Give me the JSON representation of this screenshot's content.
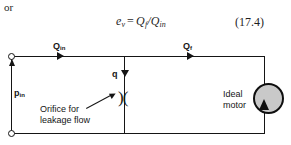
{
  "text": {
    "or": "or",
    "equation": {
      "lhs_var": "e",
      "lhs_sub": "v",
      "operator": "=",
      "num_var": "Q",
      "num_sub": "f",
      "slash": "/",
      "den_var": "Q",
      "den_sub": "in"
    },
    "equation_number": "(17.4)"
  },
  "diagram": {
    "labels": {
      "q_in_symbol": "Q",
      "q_in_sub": "in",
      "q_f_symbol": "Q",
      "q_f_sub": "f",
      "q_leak": "q",
      "p_in_symbol": "p",
      "p_in_sub": "in",
      "orifice_caption_line1": "Orifice for",
      "orifice_caption_line2": "leakage flow",
      "motor_caption_line1": "Ideal",
      "motor_caption_line2": "motor",
      "orifice_symbol": ")("
    },
    "colors": {
      "wire": "#151515",
      "motor_fill": "#c9c9c9",
      "motor_stroke": "#0f0f0f",
      "background": "#ffffff"
    }
  }
}
